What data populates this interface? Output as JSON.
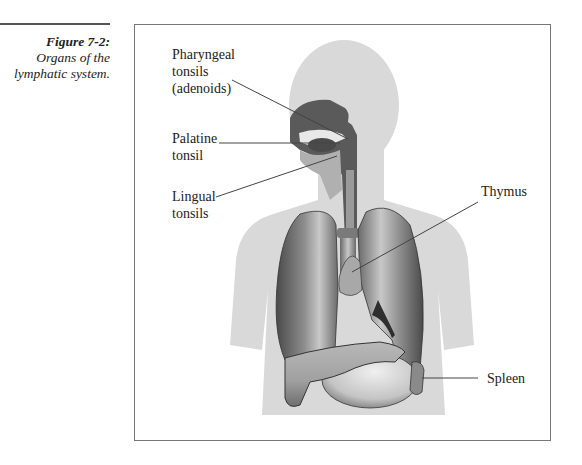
{
  "caption": {
    "figure_number": "Figure 7-2:",
    "description_line1": "Organs of the",
    "description_line2": "lymphatic system."
  },
  "labels": {
    "pharyngeal": [
      "Pharyngeal",
      "tonsils",
      "(adenoids)"
    ],
    "palatine": [
      "Palatine",
      "tonsil"
    ],
    "lingual": [
      "Lingual",
      "tonsils"
    ],
    "thymus": "Thymus",
    "spleen": "Spleen"
  },
  "colors": {
    "silhouette": "#d9d9d9",
    "organ_dark": "#5a5a5a",
    "organ_mid": "#9a9a9a",
    "organ_light": "#cfcfcf",
    "leader_line": "#444444",
    "frame": "#777777"
  }
}
